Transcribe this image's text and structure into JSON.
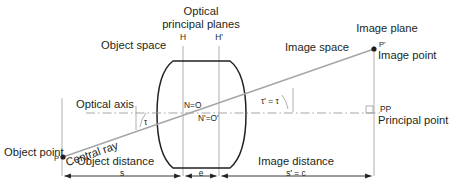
{
  "diagram": {
    "title_top": {
      "line1": "Optical",
      "line2": "principal planes"
    },
    "planes": {
      "h": "H",
      "h_prime": "H'"
    },
    "spaces": {
      "object": "Object space",
      "image": "Image space"
    },
    "image_plane_label": "Image plane",
    "image_point": {
      "marker": "P'",
      "label": "Image point"
    },
    "optical_axis_label": "Optical axis",
    "nodal": {
      "front": "N=O",
      "rear": "N'=O'"
    },
    "angles": {
      "tau": "τ",
      "tau_prime_eq_tau": "τ' = τ"
    },
    "principal_point": {
      "abbrev": "PP",
      "label": "Principal point"
    },
    "object_point": {
      "label": "Object point",
      "marker": "P"
    },
    "central_ray_label": "Central ray",
    "distances": {
      "object_distance_label": "Object distance",
      "object_distance_symbol": "s",
      "thickness_symbol": "e",
      "image_distance_label": "Image distance",
      "image_distance_symbol": "s' = c"
    },
    "colors": {
      "ink": "#231f20",
      "lens_outline": "#231f20",
      "thin_line": "#8d8d8d",
      "ray": "#a6a6a6",
      "axis_dash": "#9b9b9b",
      "background": "#ffffff"
    }
  }
}
